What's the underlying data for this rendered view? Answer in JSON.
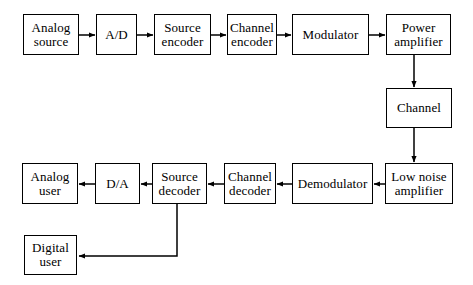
{
  "diagram": {
    "background_color": "#ffffff",
    "line_color": "#000000",
    "text_color": "#000000",
    "nodes": [
      {
        "id": "analog-source",
        "label": "Analog\nsource",
        "x": 23,
        "y": 14,
        "w": 56,
        "h": 41
      },
      {
        "id": "ad-converter",
        "label": "A/D",
        "x": 96,
        "y": 14,
        "w": 41,
        "h": 41
      },
      {
        "id": "source-encoder",
        "label": "Source\nencoder",
        "x": 154,
        "y": 14,
        "w": 57,
        "h": 41
      },
      {
        "id": "channel-encoder",
        "label": "Channel\nencoder",
        "x": 227,
        "y": 14,
        "w": 50,
        "h": 41
      },
      {
        "id": "modulator",
        "label": "Modulator",
        "x": 292,
        "y": 14,
        "w": 77,
        "h": 41
      },
      {
        "id": "power-amplifier",
        "label": "Power\namplifier",
        "x": 386,
        "y": 14,
        "w": 65,
        "h": 41
      },
      {
        "id": "channel",
        "label": "Channel",
        "x": 386,
        "y": 88,
        "w": 66,
        "h": 40
      },
      {
        "id": "low-noise-amplifier",
        "label": "Low noise\namplifier",
        "x": 385,
        "y": 163,
        "w": 68,
        "h": 41
      },
      {
        "id": "demodulator",
        "label": "Demodulator",
        "x": 292,
        "y": 163,
        "w": 81,
        "h": 41
      },
      {
        "id": "channel-decoder",
        "label": "Channel\ndecoder",
        "x": 224,
        "y": 163,
        "w": 52,
        "h": 41
      },
      {
        "id": "source-decoder",
        "label": "Source\ndecoder",
        "x": 152,
        "y": 163,
        "w": 55,
        "h": 41
      },
      {
        "id": "da-converter",
        "label": "D/A",
        "x": 95,
        "y": 163,
        "w": 45,
        "h": 41
      },
      {
        "id": "analog-user",
        "label": "Analog\nuser",
        "x": 22,
        "y": 163,
        "w": 56,
        "h": 41
      },
      {
        "id": "digital-user",
        "label": "Digital\nuser",
        "x": 24,
        "y": 235,
        "w": 53,
        "h": 40
      }
    ],
    "connectors": [
      {
        "id": "analog-source-to-ad",
        "from": "analog-source",
        "to": "ad-converter"
      },
      {
        "id": "ad-to-source-encoder",
        "from": "ad-converter",
        "to": "source-encoder"
      },
      {
        "id": "source-encoder-to-channel-encoder",
        "from": "source-encoder",
        "to": "channel-encoder"
      },
      {
        "id": "channel-encoder-to-modulator",
        "from": "channel-encoder",
        "to": "modulator"
      },
      {
        "id": "modulator-to-power-amplifier",
        "from": "modulator",
        "to": "power-amplifier"
      },
      {
        "id": "power-amplifier-to-channel",
        "from": "power-amplifier",
        "to": "channel"
      },
      {
        "id": "channel-to-low-noise-amplifier",
        "from": "channel",
        "to": "low-noise-amplifier"
      },
      {
        "id": "low-noise-amplifier-to-demodulator",
        "from": "low-noise-amplifier",
        "to": "demodulator"
      },
      {
        "id": "demodulator-to-channel-decoder",
        "from": "demodulator",
        "to": "channel-decoder"
      },
      {
        "id": "channel-decoder-to-source-decoder",
        "from": "channel-decoder",
        "to": "source-decoder"
      },
      {
        "id": "source-decoder-to-da",
        "from": "source-decoder",
        "to": "da-converter"
      },
      {
        "id": "da-to-analog-user",
        "from": "da-converter",
        "to": "analog-user"
      },
      {
        "id": "source-decoder-to-digital-user",
        "from": "source-decoder",
        "to": "digital-user"
      }
    ]
  }
}
